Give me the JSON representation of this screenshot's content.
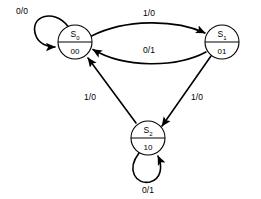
{
  "diagram": {
    "type": "finite-state-machine",
    "title": "",
    "notation": "input/output",
    "states": [
      {
        "id": "S0",
        "label": "S",
        "subscript": "0",
        "encoding": "00",
        "cx": 75,
        "cy": 42,
        "r": 17
      },
      {
        "id": "S1",
        "label": "S",
        "subscript": "1",
        "encoding": "01",
        "cx": 222,
        "cy": 42,
        "r": 17
      },
      {
        "id": "S2",
        "label": "S",
        "subscript": "2",
        "encoding": "10",
        "cx": 148,
        "cy": 138,
        "r": 17
      }
    ],
    "transitions": [
      {
        "from": "S0",
        "to": "S0",
        "input": "0",
        "output": "0",
        "label": "0/0",
        "kind": "self-loop",
        "label_x": 22,
        "label_y": 14
      },
      {
        "from": "S0",
        "to": "S1",
        "input": "1",
        "output": "0",
        "label": "1/0",
        "kind": "curve",
        "label_x": 149,
        "label_y": 16
      },
      {
        "from": "S1",
        "to": "S0",
        "input": "0",
        "output": "1",
        "label": "0/1",
        "kind": "curve",
        "label_x": 149,
        "label_y": 53
      },
      {
        "from": "S1",
        "to": "S2",
        "input": "1",
        "output": "0",
        "label": "1/0",
        "kind": "straight",
        "label_x": 197,
        "label_y": 100
      },
      {
        "from": "S2",
        "to": "S0",
        "input": "1",
        "output": "0",
        "label": "1/0",
        "kind": "straight",
        "label_x": 90,
        "label_y": 100
      },
      {
        "from": "S2",
        "to": "S2",
        "input": "0",
        "output": "1",
        "label": "0/1",
        "kind": "self-loop",
        "label_x": 148,
        "label_y": 193
      }
    ]
  }
}
